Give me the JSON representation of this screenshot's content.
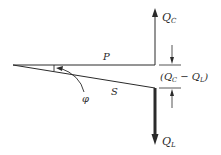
{
  "diagram": {
    "labels": {
      "qc": "Q",
      "qc_sub": "C",
      "ql": "Q",
      "ql_sub": "L",
      "p": "P",
      "s": "S",
      "phi": "φ",
      "diff_open": "(Q",
      "diff_sub1": "C",
      "diff_mid": " − Q",
      "diff_sub2": "L",
      "diff_close": ")"
    },
    "colors": {
      "line": "#2a2a2a",
      "background": "#ffffff"
    }
  }
}
